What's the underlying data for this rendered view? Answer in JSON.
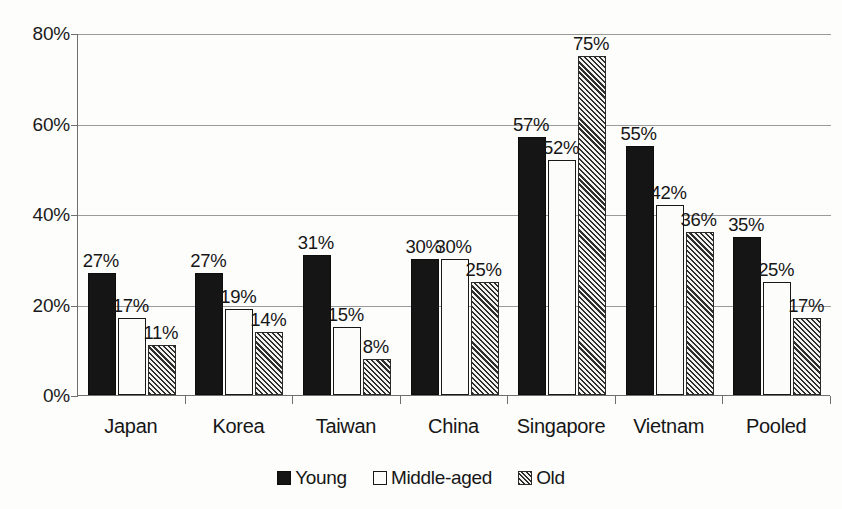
{
  "chart_data": {
    "type": "bar",
    "title": "",
    "subtitle": "",
    "xlabel": "",
    "ylabel": "",
    "categories": [
      "Japan",
      "Korea",
      "Taiwan",
      "China",
      "Singapore",
      "Vietnam",
      "Pooled"
    ],
    "series": [
      {
        "name": "Young",
        "style": "solid-black",
        "values": [
          27,
          27,
          31,
          30,
          57,
          55,
          35
        ],
        "labels": [
          "27%",
          "27%",
          "31%",
          "30%",
          "57%",
          "55%",
          "35%"
        ]
      },
      {
        "name": "Middle-aged",
        "style": "white-outline",
        "values": [
          17,
          19,
          15,
          30,
          52,
          42,
          25
        ],
        "labels": [
          "17%",
          "19%",
          "15%",
          "30%",
          "52%",
          "42%",
          "25%"
        ]
      },
      {
        "name": "Old",
        "style": "diagonal-hatch",
        "values": [
          11,
          14,
          8,
          25,
          75,
          36,
          17
        ],
        "labels": [
          "11%",
          "14%",
          "8%",
          "25%",
          "75%",
          "36%",
          "17%"
        ]
      }
    ],
    "ylim": [
      0,
      80
    ],
    "yticks": [
      0,
      20,
      40,
      60,
      80
    ],
    "ytick_labels": [
      "0%",
      "20%",
      "40%",
      "60%",
      "80%"
    ],
    "grid": true,
    "legend_position": "bottom",
    "legend_entries": [
      "Young",
      "Middle-aged",
      "Old"
    ],
    "value_labels_shown": true,
    "colors": {
      "young": "#151515",
      "middle_aged": "#fcfcfb",
      "old_hatch": "#2e2e2e",
      "gridline": "#9a9a9a",
      "axis": "#6f6f6f",
      "text": "#161616",
      "background": "#fdfdfc"
    }
  }
}
